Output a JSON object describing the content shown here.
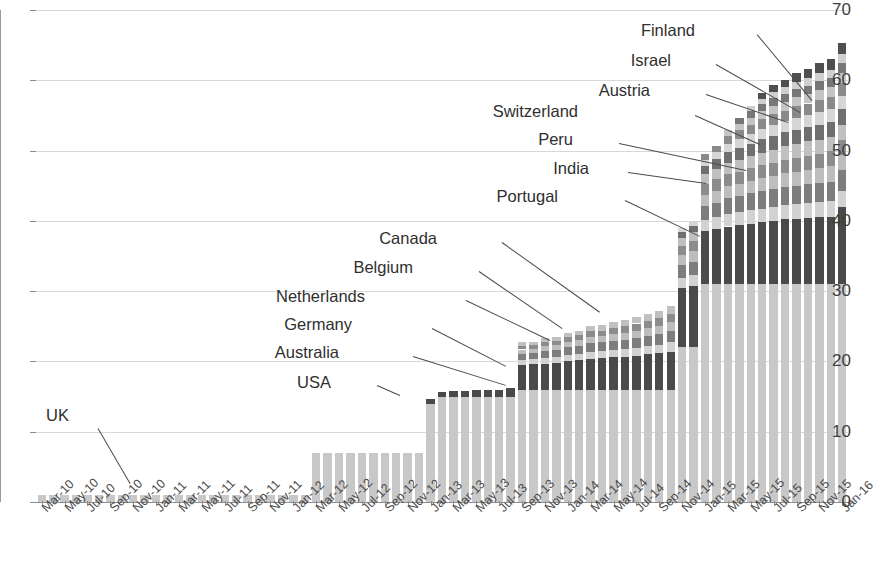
{
  "chart_data": {
    "type": "bar",
    "stacked": true,
    "title": "",
    "subtitle": "",
    "xlabel": "",
    "ylabel": "",
    "ylim": [
      0,
      70
    ],
    "yticks": [
      0,
      10,
      20,
      30,
      40,
      50,
      60,
      70
    ],
    "grid": true,
    "legend_position": "annotations",
    "x_tick_labels": [
      "Mar-10",
      "May-10",
      "Jul-10",
      "Sep-10",
      "Nov-10",
      "Jan-11",
      "Mar-11",
      "May-11",
      "Jul-11",
      "Sep-11",
      "Nov-11",
      "Jan-12",
      "Mar-12",
      "May-12",
      "Jul-12",
      "Sep-12",
      "Nov-12",
      "Jan-13",
      "Mar-13",
      "May-13",
      "Jul-13",
      "Sep-13",
      "Nov-13",
      "Jan-14",
      "Mar-14",
      "May-14",
      "Jul-14",
      "Sep-14",
      "Nov-14",
      "Jan-15",
      "Mar-15",
      "May-15",
      "Jul-15",
      "Sep-15",
      "Nov-15",
      "Jan-16"
    ],
    "x": [
      "Mar-10",
      "Apr-10",
      "May-10",
      "Jun-10",
      "Jul-10",
      "Aug-10",
      "Sep-10",
      "Oct-10",
      "Nov-10",
      "Dec-10",
      "Jan-11",
      "Feb-11",
      "Mar-11",
      "Apr-11",
      "May-11",
      "Jun-11",
      "Jul-11",
      "Aug-11",
      "Sep-11",
      "Oct-11",
      "Nov-11",
      "Dec-11",
      "Jan-12",
      "Feb-12",
      "Mar-12",
      "Apr-12",
      "May-12",
      "Jun-12",
      "Jul-12",
      "Aug-12",
      "Sep-12",
      "Oct-12",
      "Nov-12",
      "Dec-12",
      "Jan-13",
      "Feb-13",
      "Mar-13",
      "Apr-13",
      "May-13",
      "Jun-13",
      "Jul-13",
      "Aug-13",
      "Sep-13",
      "Oct-13",
      "Nov-13",
      "Dec-13",
      "Jan-14",
      "Feb-14",
      "Mar-14",
      "Apr-14",
      "May-14",
      "Jun-14",
      "Jul-14",
      "Aug-14",
      "Sep-14",
      "Oct-14",
      "Nov-14",
      "Dec-14",
      "Jan-15",
      "Feb-15",
      "Mar-15",
      "Apr-15",
      "May-15",
      "Jun-15",
      "Jul-15",
      "Aug-15",
      "Sep-15",
      "Oct-15",
      "Nov-15",
      "Dec-15",
      "Jan-16"
    ],
    "series": [
      {
        "name": "UK",
        "color": "#c8c8c8",
        "values": [
          1,
          1,
          1,
          1,
          1,
          1,
          1,
          1,
          1,
          1,
          1,
          1,
          1,
          1,
          1,
          1,
          1,
          1,
          1,
          1,
          1,
          1,
          1,
          1,
          7,
          7,
          7,
          7,
          7,
          7,
          7,
          7,
          7,
          7,
          14,
          15,
          15,
          15,
          15,
          15,
          15,
          15,
          16,
          16,
          16,
          16,
          16,
          16,
          16,
          16,
          16,
          16,
          16,
          16,
          16,
          16,
          22,
          22,
          31,
          31,
          31,
          31,
          31,
          31,
          31,
          31,
          31,
          31,
          31,
          31,
          31
        ]
      },
      {
        "name": "USA",
        "color": "#4a4a4a",
        "values": [
          0,
          0,
          0,
          0,
          0,
          0,
          0,
          0,
          0,
          0,
          0,
          0,
          0,
          0,
          0,
          0,
          0,
          0,
          0,
          0,
          0,
          0,
          0,
          0,
          0,
          0,
          0,
          0,
          0,
          0,
          0,
          0,
          0,
          0,
          0.6,
          0.7,
          0.8,
          0.8,
          0.9,
          1,
          1,
          1.2,
          3.5,
          3.6,
          3.7,
          3.8,
          4,
          4.2,
          4.4,
          4.5,
          4.6,
          4.7,
          4.8,
          5,
          5.2,
          5.4,
          8.5,
          8.8,
          7.5,
          7.8,
          8.2,
          8.4,
          8.6,
          8.8,
          9,
          9.2,
          9.3,
          9.4,
          9.5,
          9.6,
          11
        ]
      },
      {
        "name": "Australia",
        "color": "#d2d2d2",
        "values": [
          0,
          0,
          0,
          0,
          0,
          0,
          0,
          0,
          0,
          0,
          0,
          0,
          0,
          0,
          0,
          0,
          0,
          0,
          0,
          0,
          0,
          0,
          0,
          0,
          0,
          0,
          0,
          0,
          0,
          0,
          0,
          0,
          0,
          0,
          0,
          0,
          0,
          0,
          0,
          0,
          0,
          0,
          0.7,
          0.7,
          0.8,
          0.8,
          0.9,
          0.9,
          1,
          1,
          1,
          1.1,
          1.1,
          1.2,
          1.2,
          1.3,
          1.4,
          1.5,
          1.6,
          1.7,
          1.8,
          1.8,
          1.9,
          1.9,
          2,
          2,
          2.1,
          2.1,
          2.2,
          2.2,
          2.3
        ]
      },
      {
        "name": "Germany",
        "color": "#7d7d7d",
        "values": [
          0,
          0,
          0,
          0,
          0,
          0,
          0,
          0,
          0,
          0,
          0,
          0,
          0,
          0,
          0,
          0,
          0,
          0,
          0,
          0,
          0,
          0,
          0,
          0,
          0,
          0,
          0,
          0,
          0,
          0,
          0,
          0,
          0,
          0,
          0,
          0,
          0,
          0,
          0,
          0,
          0,
          0,
          0.9,
          0.9,
          1,
          1,
          1.1,
          1.1,
          1.2,
          1.2,
          1.3,
          1.3,
          1.4,
          1.4,
          1.5,
          1.6,
          1.8,
          1.9,
          2,
          2.1,
          2.2,
          2.3,
          2.4,
          2.5,
          2.5,
          2.6,
          2.6,
          2.7,
          2.7,
          2.8,
          2.9
        ]
      },
      {
        "name": "Netherlands",
        "color": "#bdbdbd",
        "values": [
          0,
          0,
          0,
          0,
          0,
          0,
          0,
          0,
          0,
          0,
          0,
          0,
          0,
          0,
          0,
          0,
          0,
          0,
          0,
          0,
          0,
          0,
          0,
          0,
          0,
          0,
          0,
          0,
          0,
          0,
          0,
          0,
          0,
          0,
          0,
          0,
          0,
          0,
          0,
          0,
          0,
          0,
          0.6,
          0.6,
          0.7,
          0.7,
          0.8,
          0.8,
          0.9,
          0.9,
          1,
          1,
          1.1,
          1.1,
          1.2,
          1.3,
          1.4,
          1.5,
          1.6,
          1.7,
          1.7,
          1.8,
          1.8,
          1.9,
          1.9,
          2,
          2,
          2.1,
          2.1,
          2.2,
          2.2
        ]
      },
      {
        "name": "Belgium",
        "color": "#8c8c8c",
        "values": [
          0,
          0,
          0,
          0,
          0,
          0,
          0,
          0,
          0,
          0,
          0,
          0,
          0,
          0,
          0,
          0,
          0,
          0,
          0,
          0,
          0,
          0,
          0,
          0,
          0,
          0,
          0,
          0,
          0,
          0,
          0,
          0,
          0,
          0,
          0,
          0,
          0,
          0,
          0,
          0,
          0,
          0,
          0.5,
          0.5,
          0.6,
          0.6,
          0.7,
          0.7,
          0.8,
          0.8,
          0.9,
          0.9,
          1,
          1,
          1.1,
          1.2,
          1.3,
          1.4,
          1.5,
          1.6,
          1.7,
          1.7,
          1.8,
          1.8,
          1.9,
          1.9,
          2,
          2,
          2,
          2.1,
          2.1
        ]
      },
      {
        "name": "Canada",
        "color": "#c0c0c0",
        "values": [
          0,
          0,
          0,
          0,
          0,
          0,
          0,
          0,
          0,
          0,
          0,
          0,
          0,
          0,
          0,
          0,
          0,
          0,
          0,
          0,
          0,
          0,
          0,
          0,
          0,
          0,
          0,
          0,
          0,
          0,
          0,
          0,
          0,
          0,
          0,
          0,
          0,
          0,
          0,
          0,
          0,
          0,
          0.5,
          0.5,
          0.5,
          0.6,
          0.6,
          0.7,
          0.7,
          0.8,
          0.8,
          0.9,
          0.9,
          1,
          1,
          1.1,
          1.2,
          1.3,
          1.4,
          1.5,
          1.6,
          1.7,
          1.7,
          1.8,
          1.8,
          1.9,
          1.9,
          2,
          2,
          2,
          2.1
        ]
      },
      {
        "name": "Portugal",
        "color": "#6f6f6f",
        "values": [
          0,
          0,
          0,
          0,
          0,
          0,
          0,
          0,
          0,
          0,
          0,
          0,
          0,
          0,
          0,
          0,
          0,
          0,
          0,
          0,
          0,
          0,
          0,
          0,
          0,
          0,
          0,
          0,
          0,
          0,
          0,
          0,
          0,
          0,
          0,
          0,
          0,
          0,
          0,
          0,
          0,
          0,
          0,
          0,
          0,
          0,
          0,
          0,
          0,
          0,
          0,
          0,
          0,
          0,
          0,
          0,
          0.8,
          0.9,
          1.2,
          1.4,
          1.6,
          1.7,
          1.8,
          1.9,
          2,
          2,
          2.1,
          2.1,
          2.2,
          2.2,
          2.3
        ]
      },
      {
        "name": "India",
        "color": "#d6d6d6",
        "values": [
          0,
          0,
          0,
          0,
          0,
          0,
          0,
          0,
          0,
          0,
          0,
          0,
          0,
          0,
          0,
          0,
          0,
          0,
          0,
          0,
          0,
          0,
          0,
          0,
          0,
          0,
          0,
          0,
          0,
          0,
          0,
          0,
          0,
          0,
          0,
          0,
          0,
          0,
          0,
          0,
          0,
          0,
          0,
          0,
          0,
          0,
          0,
          0,
          0,
          0,
          0,
          0,
          0,
          0,
          0,
          0,
          0.6,
          0.7,
          0.9,
          1,
          1.2,
          1.3,
          1.4,
          1.5,
          1.6,
          1.6,
          1.7,
          1.7,
          1.8,
          1.8,
          1.9
        ]
      },
      {
        "name": "Peru",
        "color": "#8a8a8a",
        "values": [
          0,
          0,
          0,
          0,
          0,
          0,
          0,
          0,
          0,
          0,
          0,
          0,
          0,
          0,
          0,
          0,
          0,
          0,
          0,
          0,
          0,
          0,
          0,
          0,
          0,
          0,
          0,
          0,
          0,
          0,
          0,
          0,
          0,
          0,
          0,
          0,
          0,
          0,
          0,
          0,
          0,
          0,
          0,
          0,
          0,
          0,
          0,
          0,
          0,
          0,
          0,
          0,
          0,
          0,
          0,
          0,
          0,
          0,
          0.8,
          0.9,
          1.1,
          1.2,
          1.3,
          1.4,
          1.5,
          1.5,
          1.6,
          1.6,
          1.7,
          1.7,
          1.8
        ]
      },
      {
        "name": "Switzerland",
        "color": "#c4c4c4",
        "values": [
          0,
          0,
          0,
          0,
          0,
          0,
          0,
          0,
          0,
          0,
          0,
          0,
          0,
          0,
          0,
          0,
          0,
          0,
          0,
          0,
          0,
          0,
          0,
          0,
          0,
          0,
          0,
          0,
          0,
          0,
          0,
          0,
          0,
          0,
          0,
          0,
          0,
          0,
          0,
          0,
          0,
          0,
          0,
          0,
          0,
          0,
          0,
          0,
          0,
          0,
          0,
          0,
          0,
          0,
          0,
          0,
          0,
          0,
          0,
          0,
          0.8,
          0.9,
          1,
          1.1,
          1.2,
          1.2,
          1.3,
          1.3,
          1.4,
          1.4,
          1.5
        ]
      },
      {
        "name": "Austria",
        "color": "#777777",
        "values": [
          0,
          0,
          0,
          0,
          0,
          0,
          0,
          0,
          0,
          0,
          0,
          0,
          0,
          0,
          0,
          0,
          0,
          0,
          0,
          0,
          0,
          0,
          0,
          0,
          0,
          0,
          0,
          0,
          0,
          0,
          0,
          0,
          0,
          0,
          0,
          0,
          0,
          0,
          0,
          0,
          0,
          0,
          0,
          0,
          0,
          0,
          0,
          0,
          0,
          0,
          0,
          0,
          0,
          0,
          0,
          0,
          0,
          0,
          0,
          0,
          0,
          0.8,
          0.9,
          1,
          1.1,
          1.1,
          1.2,
          1.2,
          1.3,
          1.3,
          1.4
        ]
      },
      {
        "name": "Israel",
        "color": "#cfcfcf",
        "values": [
          0,
          0,
          0,
          0,
          0,
          0,
          0,
          0,
          0,
          0,
          0,
          0,
          0,
          0,
          0,
          0,
          0,
          0,
          0,
          0,
          0,
          0,
          0,
          0,
          0,
          0,
          0,
          0,
          0,
          0,
          0,
          0,
          0,
          0,
          0,
          0,
          0,
          0,
          0,
          0,
          0,
          0,
          0,
          0,
          0,
          0,
          0,
          0,
          0,
          0,
          0,
          0,
          0,
          0,
          0,
          0,
          0,
          0,
          0,
          0,
          0,
          0,
          0.7,
          0.8,
          0.9,
          1,
          1,
          1.1,
          1.1,
          1.2,
          1.2
        ]
      },
      {
        "name": "Finland",
        "color": "#4f4f4f",
        "values": [
          0,
          0,
          0,
          0,
          0,
          0,
          0,
          0,
          0,
          0,
          0,
          0,
          0,
          0,
          0,
          0,
          0,
          0,
          0,
          0,
          0,
          0,
          0,
          0,
          0,
          0,
          0,
          0,
          0,
          0,
          0,
          0,
          0,
          0,
          0,
          0,
          0,
          0,
          0,
          0,
          0,
          0,
          0,
          0,
          0,
          0,
          0,
          0,
          0,
          0,
          0,
          0,
          0,
          0,
          0,
          0,
          0,
          0,
          0,
          0,
          0,
          0,
          0,
          0.8,
          1,
          1.1,
          1.2,
          1.3,
          1.4,
          1.5,
          1.6
        ]
      }
    ],
    "totals": [
      1,
      1,
      1,
      1,
      1,
      1,
      1,
      1,
      1,
      1,
      1,
      1,
      1,
      1,
      1,
      1,
      1,
      1,
      1,
      1,
      1,
      1,
      1,
      1,
      7,
      7,
      7,
      7,
      7,
      7,
      7,
      7,
      7,
      7,
      14.6,
      15.7,
      15.8,
      15.8,
      15.9,
      16,
      16,
      16.2,
      24.2,
      24.4,
      25,
      25.2,
      25.9,
      26.2,
      26.6,
      26.9,
      27.2,
      27.6,
      27.8,
      28.3,
      28.7,
      29.1,
      37.4,
      38.3,
      48.5,
      49.8,
      53,
      53.6,
      54.6,
      55.2,
      55.3,
      55.4,
      55.5,
      55.6,
      55.8,
      56,
      58
    ]
  },
  "annotations": [
    {
      "label": "UK",
      "x": 69,
      "y": 415
    },
    {
      "label": "USA",
      "x": 331,
      "y": 382
    },
    {
      "label": "Australia",
      "x": 339,
      "y": 352
    },
    {
      "label": "Germany",
      "x": 352,
      "y": 324
    },
    {
      "label": "Netherlands",
      "x": 365,
      "y": 296
    },
    {
      "label": "Belgium",
      "x": 413,
      "y": 267
    },
    {
      "label": "Canada",
      "x": 437,
      "y": 238
    },
    {
      "label": "Portugal",
      "x": 558,
      "y": 196
    },
    {
      "label": "India",
      "x": 589,
      "y": 168
    },
    {
      "label": "Peru",
      "x": 573,
      "y": 139
    },
    {
      "label": "Switzerland",
      "x": 578,
      "y": 111
    },
    {
      "label": "Austria",
      "x": 650,
      "y": 90
    },
    {
      "label": "Israel",
      "x": 671,
      "y": 60
    },
    {
      "label": "Finland",
      "x": 695,
      "y": 30
    }
  ],
  "leaders": [
    {
      "x1": 98,
      "y1": 428,
      "x2": 130,
      "y2": 483
    },
    {
      "x1": 377,
      "y1": 385,
      "x2": 400,
      "y2": 395
    },
    {
      "x1": 413,
      "y1": 356,
      "x2": 506,
      "y2": 385
    },
    {
      "x1": 432,
      "y1": 328,
      "x2": 506,
      "y2": 366
    },
    {
      "x1": 466,
      "y1": 300,
      "x2": 550,
      "y2": 340
    },
    {
      "x1": 479,
      "y1": 271,
      "x2": 562,
      "y2": 328
    },
    {
      "x1": 502,
      "y1": 242,
      "x2": 600,
      "y2": 312
    },
    {
      "x1": 625,
      "y1": 200,
      "x2": 700,
      "y2": 236
    },
    {
      "x1": 628,
      "y1": 172,
      "x2": 706,
      "y2": 183
    },
    {
      "x1": 619,
      "y1": 143,
      "x2": 746,
      "y2": 170
    },
    {
      "x1": 695,
      "y1": 115,
      "x2": 760,
      "y2": 144
    },
    {
      "x1": 706,
      "y1": 94,
      "x2": 788,
      "y2": 122
    },
    {
      "x1": 716,
      "y1": 64,
      "x2": 800,
      "y2": 112
    },
    {
      "x1": 757,
      "y1": 34,
      "x2": 812,
      "y2": 100
    }
  ],
  "axis": {
    "y_tick_labels": [
      "0",
      "10",
      "20",
      "30",
      "40",
      "50",
      "60",
      "70"
    ]
  }
}
